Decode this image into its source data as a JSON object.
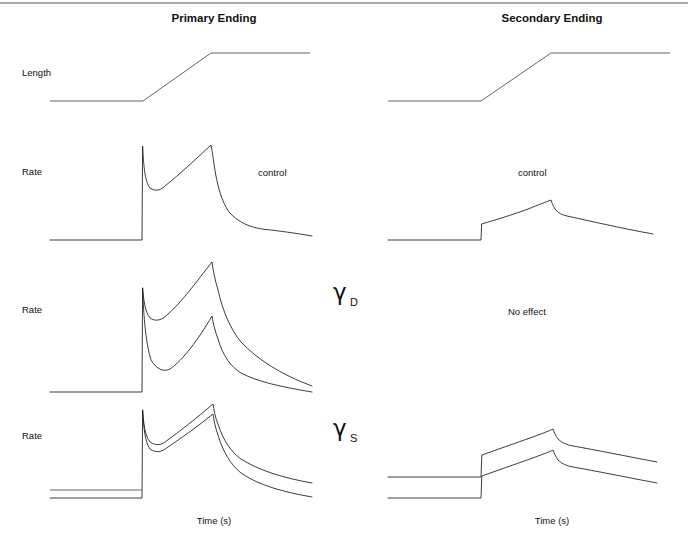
{
  "figure": {
    "columns": [
      {
        "id": "primary",
        "title": "Primary Ending",
        "title_x": 214,
        "axis_label": "Time (s)",
        "axis_x": 214,
        "axis_y": 524
      },
      {
        "id": "secondary",
        "title": "Secondary Ending",
        "title_x": 552,
        "axis_label": "Time (s)",
        "axis_x": 552,
        "axis_y": 524
      }
    ],
    "title_y": 22,
    "top_rule": {
      "x1": 0,
      "y1": 3,
      "x2": 688,
      "y2": 3
    },
    "row_labels": [
      {
        "text": "Length",
        "x": 22,
        "y": 76
      },
      {
        "text": "Rate",
        "x": 22,
        "y": 175
      },
      {
        "text": "Rate",
        "x": 22,
        "y": 313
      },
      {
        "text": "Rate",
        "x": 22,
        "y": 439
      }
    ],
    "condition_symbols": [
      {
        "base": "γ",
        "sub": "D",
        "base_x": 333,
        "base_y": 300,
        "sub_x": 350,
        "sub_y": 306
      },
      {
        "base": "γ",
        "sub": "S",
        "base_x": 333,
        "base_y": 436,
        "sub_x": 350,
        "sub_y": 442
      }
    ],
    "annotations": [
      {
        "text": "control",
        "x": 258,
        "y": 176
      },
      {
        "text": "control",
        "x": 518,
        "y": 176
      },
      {
        "text": "No effect",
        "x": 508,
        "y": 315
      }
    ],
    "traces": [
      {
        "name": "length-primary",
        "row": "length",
        "column": "primary",
        "style": "flat",
        "d": "M 50 101 L 143 101 L 211 53 L 310 53"
      },
      {
        "name": "length-secondary",
        "row": "length",
        "column": "secondary",
        "style": "flat",
        "d": "M 388 101 L 481 101 L 551 53 L 670 53"
      },
      {
        "name": "rate-primary-control",
        "row": "rate-control",
        "column": "primary",
        "style": "trace",
        "d": "M 50 240 L 142 240 L 142.6 146 C 143.6 166 145 182 150 188 C 156 192 161 190 165 186 C 180 174 196 159 211 145 C 212 150 213 157 214 164 C 217 186 222 202 229 212 C 239 223 250 227 262 229 C 280 231 295 233 312 236"
      },
      {
        "name": "rate-secondary-control",
        "row": "rate-control",
        "column": "secondary",
        "style": "trace",
        "d": "M 388 240 L 481 240 L 481.6 224 C 495 220 512 215 528 209 C 538 205 546 202 551 200 C 552 203 553 206 555 209 C 558 213 562 215 567 216 C 590 221 620 228 653 234"
      },
      {
        "name": "rate-primary-gammaD-lower",
        "row": "rate-gammaD",
        "column": "primary",
        "style": "trace",
        "d": "M 50 392 L 142 392 L 142.6 288 C 143.6 318 146 344 151 360 C 157 370 164 372 170 369 C 183 360 198 340 212 316 C 213 323 215 331 218 339 C 223 356 231 367 241 373 C 258 382 282 387 312 392"
      },
      {
        "name": "rate-primary-gammaD-upper",
        "row": "rate-gammaD",
        "column": "primary",
        "style": "trace",
        "d": "M 142.6 288 C 143.6 300 145 312 150 318 C 156 322 162 320 167 315 C 182 302 197 281 212 262 C 213 270 215 280 218 290 C 223 312 231 330 241 342 C 258 360 282 375 312 386"
      },
      {
        "name": "rate-primary-gammaS-lower",
        "row": "rate-gammaS",
        "column": "primary",
        "style": "trace",
        "d": "M 50 498 L 142 498 L 142.6 410 C 143.6 428 145 442 150 449 C 156 453 161 452 165 449 C 180 439 197 427 213 414 C 214 420 215 427 218 435 C 223 452 231 465 241 473 C 258 485 283 492 312 497"
      },
      {
        "name": "rate-primary-gammaS-upper",
        "row": "rate-gammaS",
        "column": "primary",
        "style": "trace",
        "d": "M 142.6 410 C 143.6 424 145 436 150 442 C 156 446 161 445 165 442 C 180 431 197 418 213 404 C 214 410 215 417 218 424 C 223 440 231 452 241 459 C 258 470 283 478 312 483"
      },
      {
        "name": "rate-primary-gammaS-baseline-upper",
        "row": "rate-gammaS",
        "column": "primary",
        "style": "flat",
        "d": "M 50 490 L 142 490"
      },
      {
        "name": "rate-secondary-gammaS-lower",
        "row": "rate-gammaS",
        "column": "secondary",
        "style": "trace",
        "d": "M 388 498 L 481 498 L 481.8 476 C 496 471 513 465 530 459 C 541 455 549 452 553 450 C 554 453 556 457 558 460 C 562 464 567 466 573 467 C 596 471 625 477 657 483"
      },
      {
        "name": "rate-secondary-gammaS-upper",
        "row": "rate-gammaS",
        "column": "secondary",
        "style": "trace",
        "d": "M 388 477 L 481 477 L 481.8 455 C 496 450 513 444 530 438 C 541 434 549 431 553 429 C 554 432 556 436 558 439 C 562 443 567 445 573 446 C 596 450 625 456 657 462"
      }
    ]
  },
  "chart_data": {
    "type": "line",
    "xlabel": "Time (s)",
    "ylabel": "Rate",
    "grid": false,
    "legend": "none",
    "columns": [
      "Primary Ending",
      "Secondary Ending"
    ],
    "rows": [
      "Length",
      "Rate (control)",
      "Rate (gamma-D)",
      "Rate (gamma-S)"
    ],
    "stimulus": {
      "name": "Length",
      "description": "ramp-and-hold stretch",
      "phases": [
        "initial hold",
        "ramp stretch",
        "final hold"
      ],
      "x": [
        0,
        1.0,
        1.73,
        2.8
      ],
      "y": [
        0,
        0,
        1,
        1
      ]
    },
    "series": [
      {
        "name": "Primary Ending, control",
        "column": "Primary Ending",
        "row": "Rate (control)",
        "features": [
          "resting discharge",
          "initial burst",
          "dip",
          "dynamic rise during ramp",
          "peak at end of ramp",
          "rapid adaptation decay"
        ],
        "x": [
          0,
          1.0,
          1.02,
          1.12,
          1.45,
          1.73,
          1.78,
          1.95,
          2.2,
          2.5,
          2.8
        ],
        "y": [
          0.0,
          0.0,
          1.0,
          0.55,
          0.73,
          1.02,
          0.92,
          0.56,
          0.35,
          0.22,
          0.14
        ]
      },
      {
        "name": "Secondary Ending, control",
        "column": "Secondary Ending",
        "row": "Rate (control)",
        "features": [
          "resting discharge",
          "small step",
          "slow rise during ramp",
          "small peak",
          "slow decay"
        ],
        "x": [
          0,
          1.0,
          1.02,
          1.35,
          1.73,
          1.78,
          2.1,
          2.5,
          2.8
        ],
        "y": [
          0.0,
          0.0,
          0.17,
          0.26,
          0.42,
          0.37,
          0.3,
          0.22,
          0.16
        ]
      },
      {
        "name": "Primary Ending, gamma-D lower (control repeat)",
        "column": "Primary Ending",
        "row": "Rate (gamma-D)",
        "features": [
          "initial burst",
          "dip",
          "dynamic rise",
          "peak",
          "decay"
        ],
        "x": [
          0,
          1.0,
          1.02,
          1.15,
          1.45,
          1.73,
          1.8,
          2.0,
          2.3,
          2.8
        ],
        "y": [
          0.0,
          0.0,
          1.0,
          0.52,
          0.66,
          0.83,
          0.69,
          0.44,
          0.21,
          0.02
        ]
      },
      {
        "name": "Primary Ending, gamma-D stimulation",
        "column": "Primary Ending",
        "row": "Rate (gamma-D)",
        "features": [
          "enhanced dynamic response",
          "larger initial burst",
          "higher ramp slope",
          "higher peak",
          "decay to same level"
        ],
        "x": [
          1.0,
          1.02,
          1.15,
          1.45,
          1.73,
          1.8,
          2.0,
          2.3,
          2.8
        ],
        "y": [
          0.0,
          1.0,
          0.71,
          0.86,
          1.08,
          0.93,
          0.63,
          0.33,
          0.09
        ]
      },
      {
        "name": "Secondary Ending, gamma-D stimulation",
        "column": "Secondary Ending",
        "row": "Rate (gamma-D)",
        "features": [
          "no effect"
        ],
        "x": [],
        "y": []
      },
      {
        "name": "Primary Ending, gamma-S lower (control repeat)",
        "column": "Primary Ending",
        "row": "Rate (gamma-S)",
        "features": [
          "low resting discharge",
          "initial burst",
          "dip",
          "ramp rise",
          "peak",
          "decay"
        ],
        "x": [
          0,
          1.0,
          1.02,
          1.13,
          1.45,
          1.73,
          1.8,
          2.0,
          2.3,
          2.8
        ],
        "y": [
          0.0,
          0.0,
          1.0,
          0.56,
          0.67,
          0.8,
          0.66,
          0.43,
          0.2,
          0.01
        ]
      },
      {
        "name": "Primary Ending, gamma-S stimulation",
        "column": "Primary Ending",
        "row": "Rate (gamma-S)",
        "features": [
          "raised resting discharge",
          "initial burst",
          "ramp rise",
          "peak",
          "decay to raised level",
          "parallel shift upward"
        ],
        "x": [
          0,
          1.0,
          1.02,
          1.13,
          1.45,
          1.73,
          1.8,
          2.0,
          2.3,
          2.8
        ],
        "y": [
          0.09,
          0.09,
          1.0,
          0.64,
          0.76,
          0.91,
          0.77,
          0.54,
          0.32,
          0.17
        ]
      },
      {
        "name": "Secondary Ending, gamma-S lower (control repeat)",
        "column": "Secondary Ending",
        "row": "Rate (gamma-S)",
        "features": [
          "resting discharge",
          "step",
          "slow rise",
          "peak",
          "slow decay"
        ],
        "x": [
          0,
          1.0,
          1.02,
          1.4,
          1.73,
          1.79,
          2.1,
          2.5,
          2.8
        ],
        "y": [
          0.0,
          0.0,
          0.25,
          0.37,
          0.55,
          0.51,
          0.44,
          0.35,
          0.27
        ],
        "column_row": "Rate (gamma-S)"
      },
      {
        "name": "Secondary Ending, gamma-S stimulation",
        "column": "Secondary Ending",
        "row": "Rate (gamma-S)",
        "features": [
          "raised resting discharge",
          "step",
          "slow rise",
          "peak",
          "slow decay",
          "parallel shift upward"
        ],
        "x": [
          0,
          1.0,
          1.02,
          1.4,
          1.73,
          1.79,
          2.1,
          2.5,
          2.8
        ],
        "y": [
          0.24,
          0.24,
          0.49,
          0.61,
          0.79,
          0.75,
          0.68,
          0.59,
          0.51
        ]
      }
    ],
    "annotations": [
      "control",
      "control",
      "No effect"
    ],
    "condition_labels": [
      "γD",
      "γS"
    ]
  }
}
